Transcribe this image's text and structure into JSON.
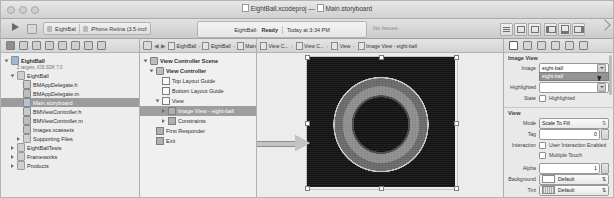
{
  "window": {
    "document_title": "EightBall.xcodeproj — Main.storyboard",
    "project_name": "EightBall.xcodeproj",
    "file_name": "Main.storyboard",
    "title_separator": "—"
  },
  "toolbar": {
    "run_label": "Run",
    "stop_label": "Stop",
    "scheme_name": "EightBall",
    "destination": "iPhone Retina (3.5-inch)",
    "status_target": "EightBall:",
    "status_state": "Ready",
    "status_time": "Today at 3:34 PM",
    "issues_label": "No Issues",
    "editor_buttons": [
      "standard-editor",
      "assistant-editor",
      "version-editor"
    ],
    "view_buttons": [
      "toggle-navigator",
      "toggle-debug-area",
      "toggle-utilities"
    ]
  },
  "navigator": {
    "filter_icons": [
      "project-navigator",
      "symbol-navigator",
      "search-navigator",
      "issue-navigator",
      "test-navigator",
      "debug-navigator",
      "breakpoint-navigator",
      "report-navigator"
    ],
    "tree": [
      {
        "label": "EightBall",
        "sub": "2 targets, iOS SDK 7.0",
        "indent": 0,
        "twisty": "open",
        "icon": "project",
        "bold": true,
        "selected": false
      },
      {
        "label": "EightBall",
        "sub": "",
        "indent": 1,
        "twisty": "open",
        "icon": "folder",
        "bold": false,
        "selected": false
      },
      {
        "label": "BMAppDelegate.h",
        "sub": "",
        "indent": 2,
        "twisty": "none",
        "icon": "header",
        "bold": false,
        "selected": false
      },
      {
        "label": "BMAppDelegate.m",
        "sub": "",
        "indent": 2,
        "twisty": "none",
        "icon": "source",
        "bold": false,
        "selected": false
      },
      {
        "label": "Main.storyboard",
        "sub": "",
        "indent": 2,
        "twisty": "none",
        "icon": "storyboard",
        "bold": false,
        "selected": true
      },
      {
        "label": "BMViewController.h",
        "sub": "",
        "indent": 2,
        "twisty": "none",
        "icon": "header",
        "bold": false,
        "selected": false
      },
      {
        "label": "BMViewController.m",
        "sub": "",
        "indent": 2,
        "twisty": "none",
        "icon": "source",
        "bold": false,
        "selected": false
      },
      {
        "label": "Images.xcassets",
        "sub": "",
        "indent": 2,
        "twisty": "none",
        "icon": "assets",
        "bold": false,
        "selected": false
      },
      {
        "label": "Supporting Files",
        "sub": "",
        "indent": 2,
        "twisty": "closed",
        "icon": "folder",
        "bold": false,
        "selected": false
      },
      {
        "label": "EightBallTests",
        "sub": "",
        "indent": 1,
        "twisty": "closed",
        "icon": "folder",
        "bold": false,
        "selected": false
      },
      {
        "label": "Frameworks",
        "sub": "",
        "indent": 1,
        "twisty": "closed",
        "icon": "folder",
        "bold": false,
        "selected": false
      },
      {
        "label": "Products",
        "sub": "",
        "indent": 1,
        "twisty": "closed",
        "icon": "folder",
        "bold": false,
        "selected": false
      }
    ]
  },
  "jumpbar": {
    "crumbs": [
      "EightBall",
      "EightBall",
      "Main.s...",
      "Main.s..."
    ],
    "canvas_crumbs": [
      "View C...",
      "View C...",
      "View",
      "Image View - eight-ball"
    ]
  },
  "outline": {
    "items": [
      {
        "label": "View Controller Scene",
        "indent": 0,
        "twisty": "open",
        "icon": "scene",
        "bold": true,
        "selected": false
      },
      {
        "label": "View Controller",
        "indent": 1,
        "twisty": "open",
        "icon": "viewcontroller",
        "bold": true,
        "selected": false
      },
      {
        "label": "Top Layout Guide",
        "indent": 2,
        "twisty": "none",
        "icon": "guide",
        "bold": false,
        "selected": false
      },
      {
        "label": "Bottom Layout Guide",
        "indent": 2,
        "twisty": "none",
        "icon": "guide",
        "bold": false,
        "selected": false
      },
      {
        "label": "View",
        "indent": 2,
        "twisty": "open",
        "icon": "view",
        "bold": false,
        "selected": false
      },
      {
        "label": "Image View - eight-ball",
        "indent": 3,
        "twisty": "closed",
        "icon": "imageview",
        "bold": false,
        "selected": true
      },
      {
        "label": "Constraints",
        "indent": 3,
        "twisty": "closed",
        "icon": "constraints",
        "bold": false,
        "selected": false
      },
      {
        "label": "First Responder",
        "indent": 1,
        "twisty": "none",
        "icon": "responder",
        "bold": false,
        "selected": false
      },
      {
        "label": "Exit",
        "indent": 1,
        "twisty": "none",
        "icon": "exit",
        "bold": false,
        "selected": false
      }
    ]
  },
  "canvas": {
    "selected_object": "Image View - eight-ball",
    "image_name": "eight-ball",
    "annotation": "arrow-pointing-to-image-view"
  },
  "inspector": {
    "tabs": [
      "file-inspector",
      "quick-help-inspector",
      "identity-inspector",
      "attributes-inspector",
      "size-inspector",
      "connections-inspector"
    ],
    "active_tab": "attributes-inspector",
    "sections": [
      {
        "title": "Image View",
        "fields": [
          {
            "label": "Image",
            "type": "combo",
            "value": "eight-ball",
            "dropdown_open": true,
            "dropdown_items": [
              "eight-ball"
            ]
          },
          {
            "label": "Highlighted",
            "type": "combo",
            "value": ""
          },
          {
            "label": "State",
            "type": "checkbox",
            "items": [
              {
                "label": "Highlighted",
                "checked": false
              }
            ]
          }
        ]
      },
      {
        "title": "View",
        "fields": [
          {
            "label": "Mode",
            "type": "select",
            "value": "Scale To Fill"
          },
          {
            "label": "Tag",
            "type": "stepper",
            "value": "0"
          },
          {
            "label": "Interaction",
            "type": "checkbox",
            "items": [
              {
                "label": "User Interaction Enabled",
                "checked": false
              },
              {
                "label": "Multiple Touch",
                "checked": false
              }
            ]
          },
          {
            "label": "Alpha",
            "type": "stepper",
            "value": "1"
          },
          {
            "label": "Background",
            "type": "color",
            "value": "Default"
          },
          {
            "label": "Tint",
            "type": "color",
            "value": "Default"
          }
        ]
      }
    ]
  }
}
